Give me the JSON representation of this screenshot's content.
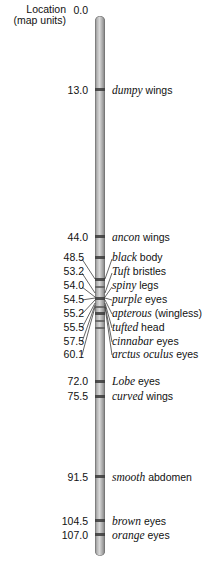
{
  "header": {
    "location_label_line1": "Location",
    "location_label_line2": "(map units)",
    "start_value": "0.0"
  },
  "genes": [
    {
      "loc": "13.0",
      "gene": "dumpy",
      "trait": " wings"
    },
    {
      "loc": "44.0",
      "gene": "ancon",
      "trait": " wings"
    },
    {
      "loc": "48.5",
      "gene": "black",
      "trait": " body"
    },
    {
      "loc": "53.2",
      "gene": "Tuft",
      "trait": " bristles"
    },
    {
      "loc": "54.0",
      "gene": "spiny",
      "trait": " legs"
    },
    {
      "loc": "54.5",
      "gene": "purple",
      "trait": " eyes"
    },
    {
      "loc": "55.2",
      "gene": "apterous",
      "trait": " (wingless)"
    },
    {
      "loc": "55.5",
      "gene": "tufted",
      "trait": " head"
    },
    {
      "loc": "57.5",
      "gene": "cinnabar",
      "trait": " eyes"
    },
    {
      "loc": "60.1",
      "gene": "arctus oculus",
      "trait": " eyes"
    },
    {
      "loc": "72.0",
      "gene": "Lobe",
      "trait": " eyes"
    },
    {
      "loc": "75.5",
      "gene": "curved",
      "trait": " wings"
    },
    {
      "loc": "91.5",
      "gene": "smooth",
      "trait": " abdomen"
    },
    {
      "loc": "104.5",
      "gene": "brown",
      "trait": " eyes"
    },
    {
      "loc": "107.0",
      "gene": "orange",
      "trait": " eyes"
    }
  ],
  "colors": {
    "chromosome": "#b4b4b4",
    "band": "#3a3a3a",
    "text": "#111111"
  }
}
